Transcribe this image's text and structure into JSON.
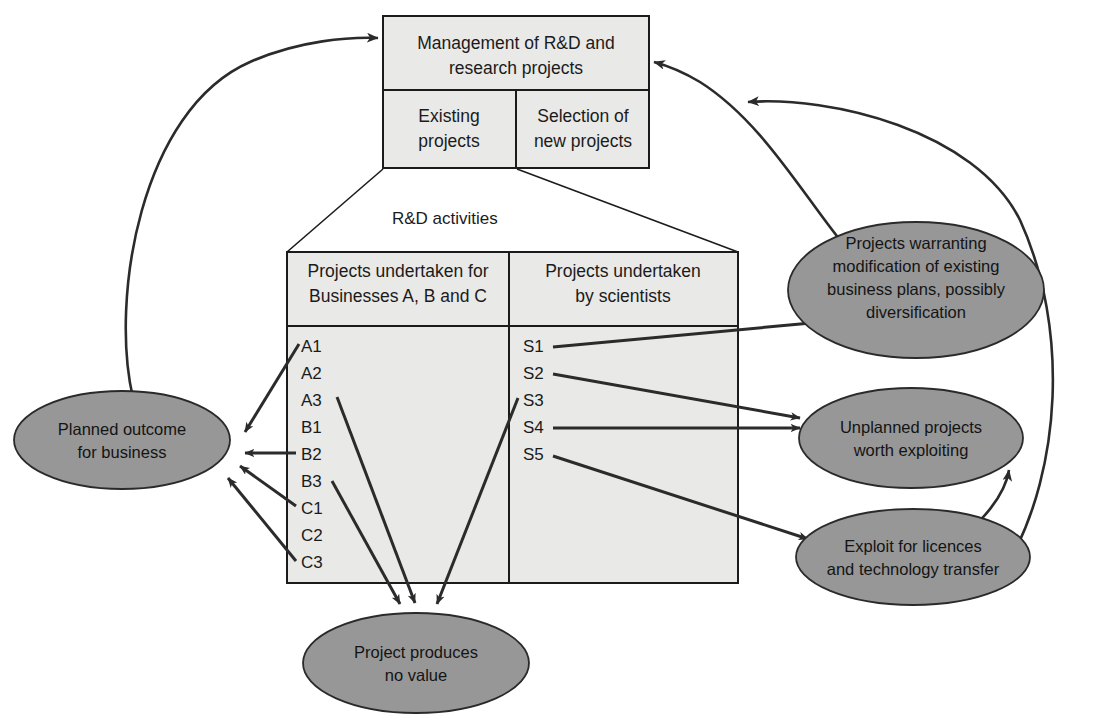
{
  "diagram": {
    "title_box": {
      "header": [
        "Management of R&D and",
        "research projects"
      ],
      "cells": [
        {
          "lines": [
            "Existing",
            "projects"
          ]
        },
        {
          "lines": [
            "Selection of",
            "new projects"
          ]
        }
      ]
    },
    "caption": "R&D activities",
    "activities_box": {
      "columns": [
        {
          "header": [
            "Projects undertaken for",
            "Businesses A, B and C"
          ],
          "items": [
            "A1",
            "A2",
            "A3",
            "B1",
            "B2",
            "B3",
            "C1",
            "C2",
            "C3"
          ]
        },
        {
          "header": [
            "Projects undertaken",
            "by scientists"
          ],
          "items": [
            "S1",
            "S2",
            "S3",
            "S4",
            "S5"
          ]
        }
      ]
    },
    "outcomes": [
      {
        "id": "planned-outcome",
        "lines": [
          "Planned outcome",
          "for business"
        ]
      },
      {
        "id": "warranting-modification",
        "lines": [
          "Projects warranting",
          "modification of existing",
          "business plans, possibly",
          "diversification"
        ]
      },
      {
        "id": "unplanned-projects",
        "lines": [
          "Unplanned projects",
          "worth exploiting"
        ]
      },
      {
        "id": "exploit-licences",
        "lines": [
          "Exploit for licences",
          "and technology transfer"
        ]
      },
      {
        "id": "no-value",
        "lines": [
          "Project produces",
          "no value"
        ]
      }
    ],
    "colors": {
      "box_fill": "#e9e9e7",
      "ellipse_fill": "#979797",
      "stroke": "#1b1b1b",
      "arrow": "#2b2b2b",
      "background": "#ffffff"
    }
  }
}
